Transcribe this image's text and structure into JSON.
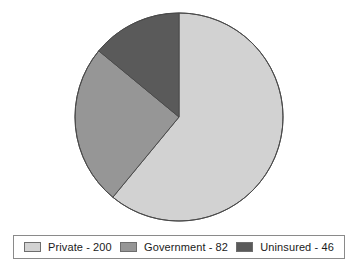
{
  "chart_data": {
    "type": "pie",
    "title": "",
    "subtitle": "",
    "xlabel": "",
    "ylabel": "",
    "categories": [
      "Private",
      "Government",
      "Uninsured"
    ],
    "values": [
      200,
      82,
      46
    ],
    "total": 328,
    "start_angle_deg": 0,
    "direction": "clockwise",
    "legend_position": "bottom",
    "grid": false,
    "slices": [
      {
        "label": "Private",
        "value": 200,
        "legend_text": "Private - 200",
        "color": "#d2d2d2",
        "sweep_deg": 219.5,
        "start_deg": 0,
        "end_deg": 219.5
      },
      {
        "label": "Government",
        "value": 82,
        "legend_text": "Government - 82",
        "color": "#969696",
        "sweep_deg": 90.0,
        "start_deg": 219.5,
        "end_deg": 309.5
      },
      {
        "label": "Uninsured",
        "value": 46,
        "legend_text": "Uninsured - 46",
        "color": "#5a5a5a",
        "sweep_deg": 50.5,
        "start_deg": 309.5,
        "end_deg": 360.0
      }
    ],
    "geometry": {
      "center_x": 179,
      "center_y": 117,
      "radius": 104
    },
    "colors": {
      "outline": "#4a4a4a",
      "legend_border": "#8a8a8a",
      "background": "#ffffff",
      "text": "#1a1a1a"
    }
  },
  "legend": {
    "items": [
      {
        "label": "Private - 200",
        "swatch_name": "legend-swatch-private"
      },
      {
        "label": "Government - 82",
        "swatch_name": "legend-swatch-government"
      },
      {
        "label": "Uninsured - 46",
        "swatch_name": "legend-swatch-uninsured"
      }
    ]
  }
}
